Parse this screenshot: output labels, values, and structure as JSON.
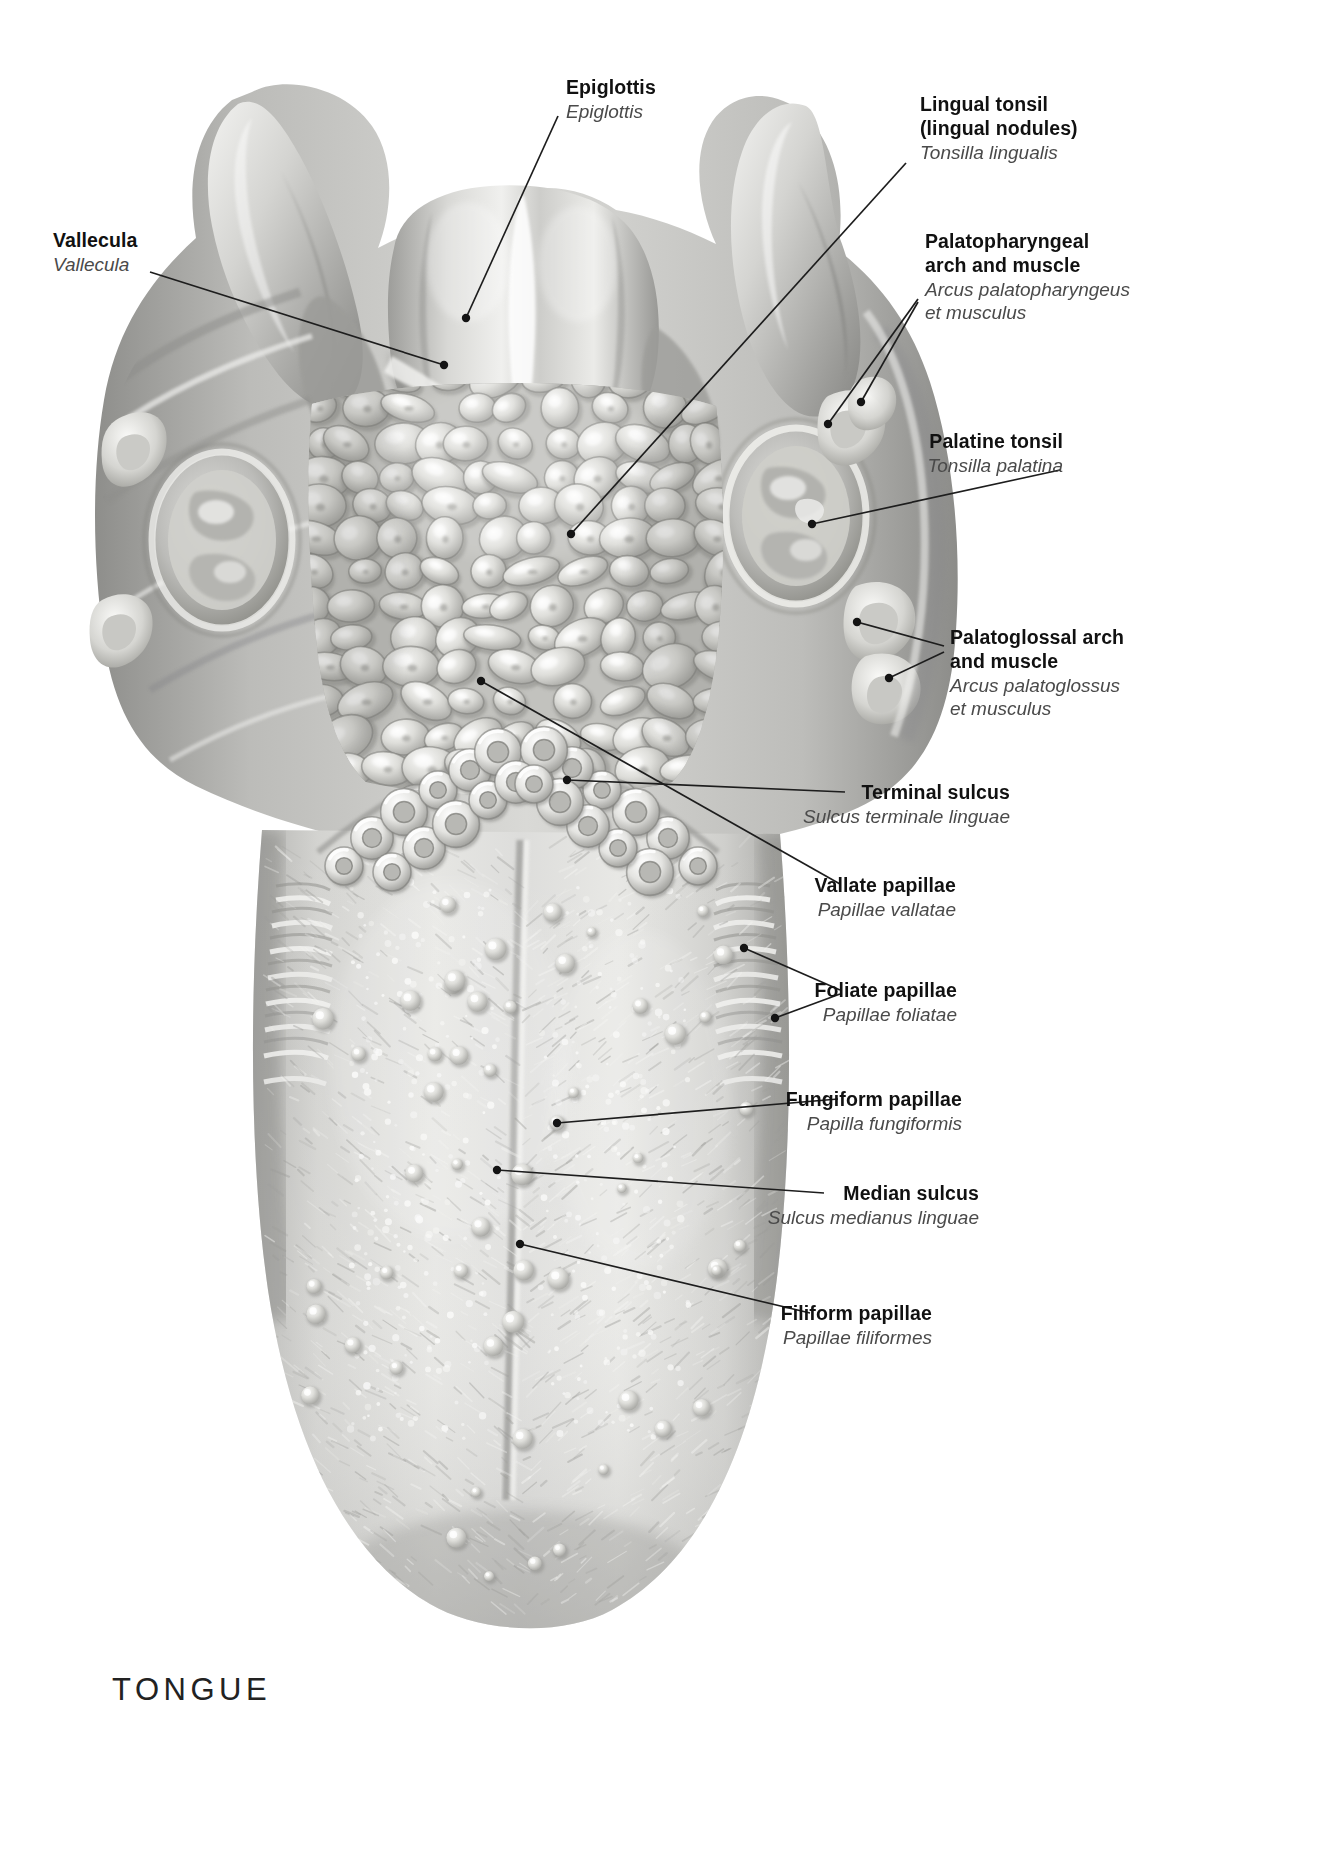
{
  "plate": {
    "title": "TONGUE",
    "subject": "dorsum of the tongue, superior view",
    "style": "grayscale anatomical airbrush illustration"
  },
  "labels": [
    {
      "id": "epiglottis",
      "en": "Epiglottis",
      "la": "Epiglottis",
      "align": "left",
      "x": 566,
      "y": 76,
      "leader": [
        [
          558,
          116
        ],
        [
          466,
          318
        ]
      ],
      "dot": [
        466,
        318
      ]
    },
    {
      "id": "lingual-tonsil",
      "en": "Lingual tonsil\n(lingual nodules)",
      "en_lines": [
        "Lingual tonsil",
        "(lingual nodules)"
      ],
      "la": "Tonsilla lingualis",
      "align": "left",
      "x": 920,
      "y": 93,
      "leader": [
        [
          906,
          163
        ],
        [
          571,
          534
        ]
      ],
      "dot": [
        571,
        534
      ]
    },
    {
      "id": "vallecula",
      "en": "Vallecula",
      "la": "Vallecula",
      "align": "left",
      "x": 53,
      "y": 229,
      "leader": [
        [
          150,
          272
        ],
        [
          444,
          365
        ]
      ],
      "dot": [
        444,
        365
      ]
    },
    {
      "id": "palatopharyngeal-arch",
      "en_lines": [
        "Palatopharyngeal",
        "arch and muscle"
      ],
      "la_lines": [
        "Arcus palatopharyngeus",
        "et musculus"
      ],
      "align": "left",
      "x": 925,
      "y": 230,
      "leader": [
        [
          918,
          299
        ],
        [
          828,
          424
        ]
      ],
      "leader2": [
        [
          918,
          302
        ],
        [
          861,
          402
        ]
      ],
      "dot": [
        828,
        424
      ],
      "dot2": [
        861,
        402
      ]
    },
    {
      "id": "palatine-tonsil",
      "en": "Palatine tonsil",
      "la": "Tonsilla palatina",
      "align": "right",
      "x": 1063,
      "y": 430,
      "leader": [
        [
          1060,
          470
        ],
        [
          812,
          524
        ]
      ],
      "dot": [
        812,
        524
      ]
    },
    {
      "id": "palatoglossal-arch",
      "en_lines": [
        "Palatoglossal arch",
        "and muscle"
      ],
      "la_lines": [
        "Arcus palatoglossus",
        "et musculus"
      ],
      "align": "left",
      "x": 950,
      "y": 626,
      "leader": [
        [
          944,
          646
        ],
        [
          857,
          622
        ]
      ],
      "leader2": [
        [
          944,
          652
        ],
        [
          889,
          678
        ]
      ],
      "dot": [
        857,
        622
      ],
      "dot2": [
        889,
        678
      ]
    },
    {
      "id": "terminal-sulcus",
      "en": "Terminal sulcus",
      "la": "Sulcus terminale linguae",
      "align": "right",
      "x": 1010,
      "y": 781,
      "leader": [
        [
          845,
          792
        ],
        [
          567,
          780
        ]
      ],
      "dot": [
        567,
        780
      ]
    },
    {
      "id": "vallate-papillae",
      "en": "Vallate papillae",
      "la": "Papillae vallatae",
      "align": "right",
      "x": 956,
      "y": 874,
      "leader": [
        [
          840,
          884
        ],
        [
          481,
          681
        ]
      ],
      "dot": [
        481,
        681
      ]
    },
    {
      "id": "foliate-papillae",
      "en": "Foliate papillae",
      "la": "Papillae foliatae",
      "align": "right",
      "x": 957,
      "y": 979,
      "leader": [
        [
          840,
          990
        ],
        [
          744,
          948
        ]
      ],
      "leader2": [
        [
          840,
          994
        ],
        [
          775,
          1018
        ]
      ],
      "dot": [
        744,
        948
      ],
      "dot2": [
        775,
        1018
      ]
    },
    {
      "id": "fungiform-papillae",
      "en": "Fungiform papillae",
      "la": "Papilla fungiformis",
      "align": "right",
      "x": 962,
      "y": 1088,
      "leader": [
        [
          838,
          1099
        ],
        [
          557,
          1123
        ]
      ],
      "dot": [
        557,
        1123
      ]
    },
    {
      "id": "median-sulcus",
      "en": "Median sulcus",
      "la": "Sulcus medianus linguae",
      "align": "right",
      "x": 979,
      "y": 1182,
      "leader": [
        [
          824,
          1193
        ],
        [
          497,
          1170
        ]
      ],
      "dot": [
        497,
        1170
      ]
    },
    {
      "id": "filiform-papillae",
      "en": "Filiform papillae",
      "la": "Papillae filiformes",
      "align": "right",
      "x": 932,
      "y": 1302,
      "leader": [
        [
          810,
          1313
        ],
        [
          520,
          1244
        ]
      ],
      "dot": [
        520,
        1244
      ]
    }
  ],
  "colors": {
    "label_en": "#111111",
    "label_la": "#4a4a4a",
    "leader_line": "#1d1d1d",
    "background": "#ffffff",
    "tissue_light": "#e9e9e7",
    "tissue_mid": "#c9c9c6",
    "tissue_dark": "#9a9a97",
    "tissue_shadow": "#6e6e6c"
  },
  "structures": [
    "epiglottis",
    "vallecula",
    "lingual tonsil",
    "palatopharyngeal arch and muscle",
    "palatine tonsil",
    "palatoglossal arch and muscle",
    "terminal sulcus",
    "vallate papillae",
    "foliate papillae",
    "fungiform papillae",
    "median sulcus",
    "filiform papillae"
  ]
}
